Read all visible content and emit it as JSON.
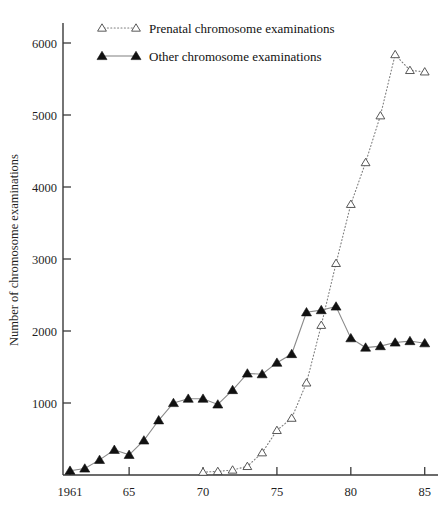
{
  "chart_data": {
    "type": "line",
    "title": "",
    "xlabel": "",
    "ylabel": "Number of chromosome examinations",
    "xlim": [
      1961,
      1985.6
    ],
    "ylim": [
      0,
      6350
    ],
    "grid": false,
    "legend_position": "top-left",
    "x_ticks": [
      1961,
      1965,
      1970,
      1975,
      1980,
      1985
    ],
    "x_tick_labels": [
      "1961",
      "65",
      "70",
      "75",
      "80",
      "85"
    ],
    "y_ticks": [
      1000,
      2000,
      3000,
      4000,
      5000,
      6000
    ],
    "y_tick_labels": [
      "1000",
      "2000",
      "3000",
      "4000",
      "5000",
      "6000"
    ],
    "x": [
      1961,
      1962,
      1963,
      1964,
      1965,
      1966,
      1967,
      1968,
      1969,
      1970,
      1971,
      1972,
      1973,
      1974,
      1975,
      1976,
      1977,
      1978,
      1979,
      1980,
      1981,
      1982,
      1983,
      1984,
      1985
    ],
    "series": [
      {
        "name": "Prenatal chromosome examinations",
        "marker": "open-triangle",
        "linestyle": "dotted",
        "color": "#454545",
        "x": [
          1970,
          1971,
          1972,
          1973,
          1974,
          1975,
          1976,
          1977,
          1978,
          1979,
          1980,
          1981,
          1982,
          1983,
          1984,
          1985
        ],
        "values": [
          40,
          50,
          70,
          120,
          310,
          620,
          790,
          1280,
          2080,
          2940,
          3760,
          4340,
          4990,
          5840,
          5620,
          5600
        ]
      },
      {
        "name": "Other chromosome examinations",
        "marker": "filled-triangle",
        "linestyle": "solid",
        "color": "#111111",
        "x": [
          1961,
          1962,
          1963,
          1964,
          1965,
          1966,
          1967,
          1968,
          1969,
          1970,
          1971,
          1972,
          1973,
          1974,
          1975,
          1976,
          1977,
          1978,
          1979,
          1980,
          1981,
          1982,
          1983,
          1984,
          1985
        ],
        "values": [
          60,
          90,
          210,
          350,
          280,
          480,
          760,
          1000,
          1060,
          1060,
          980,
          1180,
          1410,
          1400,
          1560,
          1680,
          2260,
          2290,
          2340,
          1900,
          1770,
          1790,
          1840,
          1860,
          1830
        ]
      }
    ],
    "legend": [
      {
        "label": "Prenatal chromosome examinations",
        "marker": "open-triangle",
        "linestyle": "dotted"
      },
      {
        "label": "Other chromosome examinations",
        "marker": "filled-triangle",
        "linestyle": "solid"
      }
    ],
    "colors": {
      "axis": "#3a3a3a",
      "solid_line": "#8a8a8a",
      "dotted_line": "#7d7d7d",
      "filled_marker": "#111111",
      "open_marker_stroke": "#454545",
      "background": "#ffffff"
    }
  }
}
